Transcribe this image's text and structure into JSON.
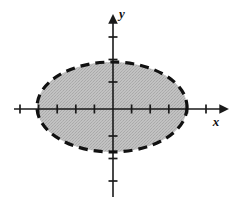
{
  "figure": {
    "background_color": "#ffffff",
    "width": 236,
    "height": 209
  },
  "axes": {
    "x_axis": {
      "label": "x",
      "label_position": {
        "x": 216,
        "y": 126
      },
      "line": {
        "x1": 14,
        "y1": 109,
        "x2": 229,
        "y2": 109
      },
      "color": "#1a1a1a",
      "stroke_width": 1.6,
      "arrow": "right",
      "tick_length": 9,
      "tick_spacing": 18.6,
      "ticks": [
        20,
        38.6,
        57.2,
        75.8,
        94.4,
        131.6,
        150.2,
        168.8,
        187.4,
        206
      ]
    },
    "y_axis": {
      "label": "y",
      "label_position": {
        "x": 122,
        "y": 18
      },
      "line": {
        "x1": 113,
        "y1": 197,
        "x2": 113,
        "y2": 14
      },
      "color": "#1a1a1a",
      "stroke_width": 1.6,
      "arrow": "up",
      "tick_length": 9,
      "tick_spacing": 22.5,
      "ticks": [
        37,
        59.5,
        82,
        136,
        158.5,
        181
      ]
    },
    "origin": {
      "x": 113,
      "y": 109
    }
  },
  "region": {
    "shape": "ellipse",
    "center": {
      "x": 112,
      "y": 107
    },
    "radius_x": 75,
    "radius_y": 45,
    "fill_color": "#bcbcbc",
    "fill_style": "stipple-halftone",
    "boundary": {
      "style": "dashed",
      "color": "#111111",
      "stroke_width": 3.2,
      "dash_pattern": "9 6",
      "included": false
    },
    "semantic": "open region bounded by a dashed ellipse, interior shaded"
  },
  "colors": {
    "ink": "#1a1a1a",
    "shade": "#bcbcbc",
    "paper": "#ffffff"
  }
}
